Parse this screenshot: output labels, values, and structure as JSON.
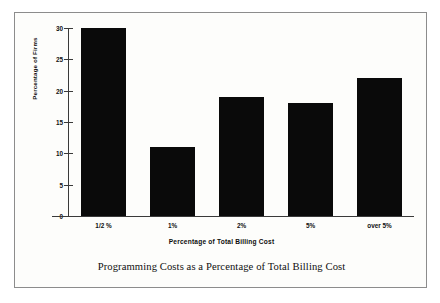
{
  "chart_data": {
    "type": "bar",
    "title": "Programming Costs as a Percentage of Total Billing Cost",
    "categories": [
      "1/2 %",
      "1%",
      "2%",
      "5%",
      "over 5%"
    ],
    "values": [
      30,
      11,
      19,
      18,
      22
    ],
    "xlabel": "Percentage of Total Billing Cost",
    "ylabel": "Percentage of Firms",
    "ylim": [
      0,
      30
    ],
    "yticks": [
      0,
      5,
      10,
      15,
      20,
      25,
      30
    ],
    "grid": false,
    "legend": null,
    "bar_color": "#0a0a0a",
    "axis_color": "#3a3a3a",
    "background_color": "#fdfdfb",
    "frame_color": "#8c8c8c"
  },
  "figure": {
    "caption": "Programming Costs as a Percentage of Total Billing Cost"
  }
}
